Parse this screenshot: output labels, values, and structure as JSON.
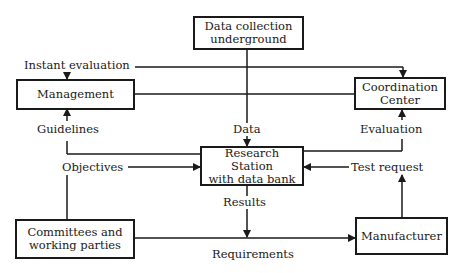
{
  "nodes": {
    "data_collection": {
      "line1": "Data collection",
      "line2": "underground"
    },
    "management": {
      "line1": "Management"
    },
    "coordination": {
      "line1": "Coordination",
      "line2": "Center"
    },
    "research": {
      "line1": "Research",
      "line2": "Station",
      "line3": "with data bank"
    },
    "committees": {
      "line1": "Committees and",
      "line2": "working parties"
    },
    "manufacturer": {
      "line1": "Manufacturer"
    }
  },
  "edges": {
    "instant_evaluation": "Instant evaluation",
    "guidelines": "Guidelines",
    "data": "Data",
    "evaluation": "Evaluation",
    "objectives": "Objectives",
    "test_request": "Test request",
    "results": "Results",
    "requirements": "Requirements"
  }
}
